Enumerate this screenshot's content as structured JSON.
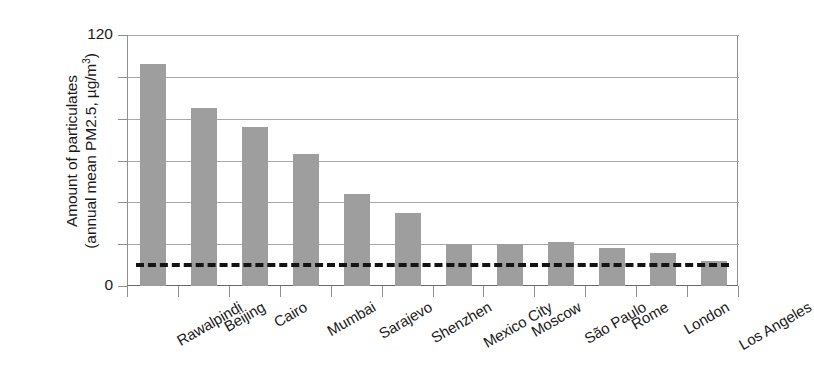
{
  "chart_data": {
    "type": "bar",
    "title": "",
    "xlabel": "",
    "ylabel": "Amount of particulates (annual mean PM2.5, µg/m³)",
    "ylabel_line1": "Amount of particulates",
    "ylabel_line2_prefix": "(annual mean PM2.5, µg/m",
    "ylabel_line2_exponent": "3",
    "ylabel_line2_suffix": ")",
    "categories": [
      "Rawalpindi",
      "Beijing",
      "Cairo",
      "Mumbai",
      "Sarajevo",
      "Shenzhen",
      "Mexico City",
      "Moscow",
      "São Paulo",
      "Rome",
      "London",
      "Los Angeles"
    ],
    "values": [
      106,
      85,
      76,
      63,
      44,
      35,
      20,
      20,
      21,
      18,
      16,
      12
    ],
    "ylim": [
      0,
      120
    ],
    "ytick_values": [
      0,
      120
    ],
    "ytick_labels": [
      "0",
      "120"
    ],
    "gridline_values": [
      20,
      40,
      60,
      80,
      100,
      120
    ],
    "grid": true,
    "legend": "none",
    "bar_color": "#9e9e9e",
    "grid_color": "#a9a9a9",
    "axis_color": "#8f8f8f",
    "reference_line": {
      "value": 11,
      "style": "dashed",
      "color": "#141414"
    }
  }
}
